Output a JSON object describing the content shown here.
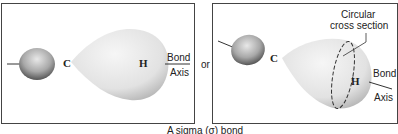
{
  "panels": [
    {
      "id": "side-view",
      "atoms": {
        "c": "C",
        "h": "H"
      },
      "axis_label": {
        "line1": "Bond",
        "line2": "Axis"
      }
    },
    {
      "id": "perspective-view",
      "atoms": {
        "c": "C",
        "h": "H"
      },
      "annotation": {
        "line1": "Circular",
        "line2": "cross section"
      },
      "axis_label": {
        "line1": "Bond",
        "line2": "Axis"
      }
    }
  ],
  "connector": "or",
  "caption": "A sigma (σ) bond",
  "colors": {
    "lobe_light": "#f2f2f2",
    "lobe_shade": "#bdbdbd",
    "small_lobe_dark": "#6e6e6e",
    "border": "#444444"
  }
}
